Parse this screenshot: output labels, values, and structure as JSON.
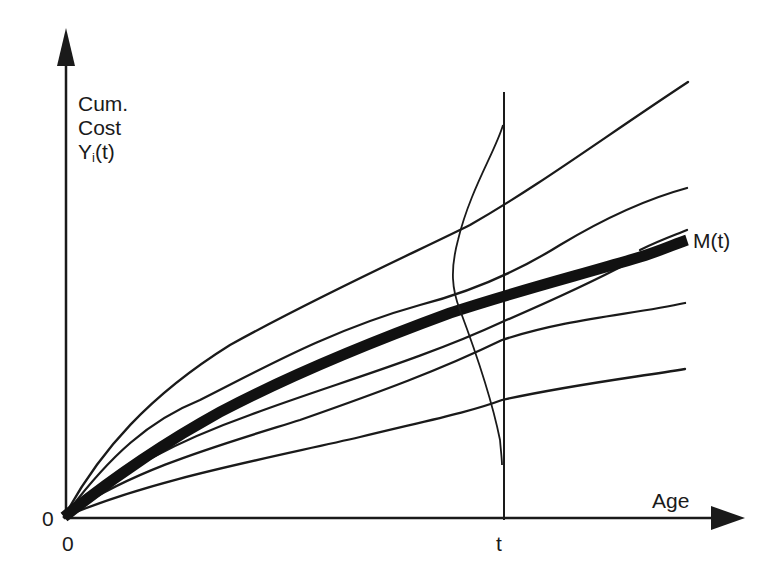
{
  "chart_data": {
    "type": "line",
    "title": "",
    "xlabel": "Age",
    "ylabel": "Cum. Cost Y_i(t)",
    "ylabel_lines": [
      "Cum.",
      "Cost",
      "Y",
      "i",
      "(t)"
    ],
    "x_ticks": [
      "0",
      "t"
    ],
    "y_ticks": [
      "0"
    ],
    "mean_label": "M(t)",
    "grid": false,
    "legend": "none",
    "series": [
      {
        "name": "Y1",
        "path": "M64,517 C100,450 150,395 230,345 C320,295 420,250 470,225 C540,185 600,140 688,82"
      },
      {
        "name": "Y2",
        "path": "M64,517 C110,455 150,420 200,400 C260,370 330,330 420,305 C470,292 520,270 560,245 C610,215 650,198 687,188"
      },
      {
        "name": "Y3",
        "path": "M64,517 C120,470 180,440 250,415 C330,385 420,360 502,322 C560,297 600,278 630,262"
      },
      {
        "name": "Y4",
        "path": "M64,517 C130,470 220,445 300,420 C380,392 440,370 502,340 C570,318 630,315 685,303"
      },
      {
        "name": "Y5",
        "path": "M64,517 C150,480 260,460 360,437 C430,420 470,412 502,400 C570,385 630,378 685,369"
      },
      {
        "name": "Y6-split",
        "path": "M640,250 C660,240 675,235 687,230"
      }
    ],
    "mean": {
      "name": "M(t)",
      "path": "M64,517 C110,480 160,445 220,412 C300,370 390,335 450,313 C520,290 580,275 640,257 C660,251 675,244 687,240"
    },
    "density_at_t": {
      "path": "M503,125 C496,150 470,190 458,240 C450,270 452,290 460,310 C475,350 492,400 500,440 C501,452 502,460 502,465"
    },
    "axes": {
      "origin": [
        64,
        517
      ],
      "x_end": [
        745,
        518
      ],
      "y_end": [
        66,
        28
      ],
      "t_line_x": 504,
      "t_line_top": 92
    }
  },
  "labels": {
    "y_title_line1": "Cum.",
    "y_title_line2": "Cost",
    "y_title_Y": "Y",
    "y_title_sub": "i",
    "y_title_arg": "(t)",
    "x_title": "Age",
    "origin_y": "0",
    "origin_x": "0",
    "t_tick": "t",
    "mean": "M(t)"
  },
  "colors": {
    "ink": "#1a1a1a",
    "background": "#ffffff"
  }
}
